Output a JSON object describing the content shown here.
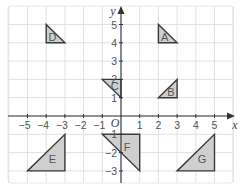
{
  "diagram": {
    "type": "coordinate-grid-with-triangles",
    "x_axis": {
      "label": "x",
      "range": [
        -6,
        6
      ],
      "ticks": [
        -5,
        -4,
        -3,
        -2,
        -1,
        1,
        2,
        3,
        4,
        5
      ]
    },
    "y_axis": {
      "label": "y",
      "range": [
        -4,
        5.8
      ],
      "ticks": [
        -3,
        -2,
        -1,
        1,
        2,
        3,
        4,
        5
      ]
    },
    "origin_label": "O",
    "grid": true,
    "colors": {
      "fill": "#cfcfcf",
      "stroke": "#3a3a3a",
      "grid": "#d9d9d9"
    },
    "shapes": [
      {
        "label": "A",
        "vertices": [
          [
            2,
            5
          ],
          [
            2,
            4
          ],
          [
            3,
            4
          ]
        ]
      },
      {
        "label": "B",
        "vertices": [
          [
            2,
            1
          ],
          [
            3,
            1
          ],
          [
            3,
            2
          ]
        ]
      },
      {
        "label": "C",
        "vertices": [
          [
            -1,
            2
          ],
          [
            0,
            2
          ],
          [
            0,
            1
          ]
        ]
      },
      {
        "label": "D",
        "vertices": [
          [
            -4,
            5
          ],
          [
            -4,
            4
          ],
          [
            -3,
            4
          ]
        ]
      },
      {
        "label": "E",
        "vertices": [
          [
            -5,
            -3
          ],
          [
            -3,
            -3
          ],
          [
            -3,
            -1
          ]
        ]
      },
      {
        "label": "F",
        "vertices": [
          [
            -1,
            -1
          ],
          [
            1,
            -1
          ],
          [
            1,
            -3
          ]
        ]
      },
      {
        "label": "G",
        "vertices": [
          [
            3,
            -3
          ],
          [
            5,
            -3
          ],
          [
            5,
            -1
          ]
        ]
      }
    ]
  }
}
